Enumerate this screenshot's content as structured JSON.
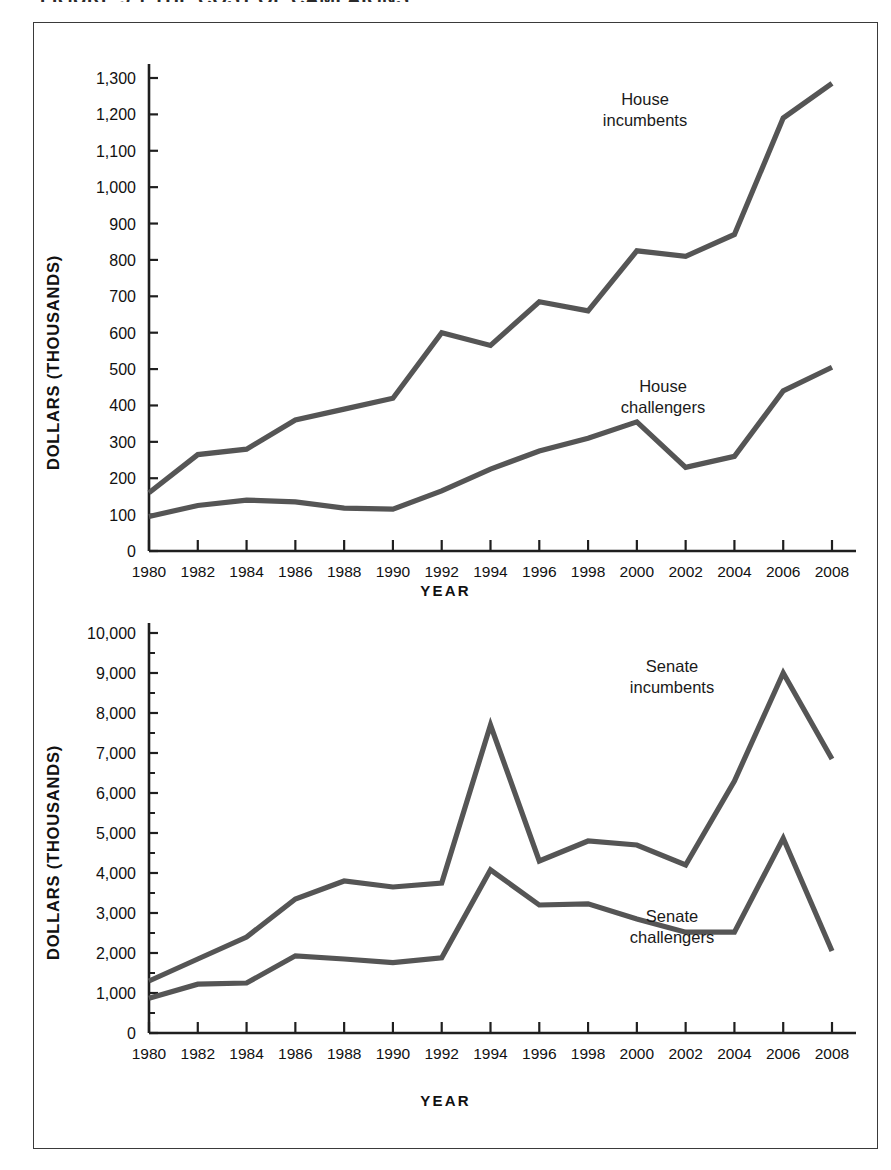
{
  "figure": {
    "title": "FIGURE 9.1  THE COST OF CAMPAIGNS",
    "frame_color": "#3a3a3a",
    "line_color": "#555555",
    "background": "#ffffff"
  },
  "chart_data": [
    {
      "id": "house",
      "type": "line",
      "title": "",
      "xlabel": "YEAR",
      "ylabel": "DOLLARS (THOUSANDS)",
      "x": [
        1980,
        1982,
        1984,
        1986,
        1988,
        1990,
        1992,
        1994,
        1996,
        1998,
        2000,
        2002,
        2004,
        2006,
        2008
      ],
      "xticklabels": [
        "1980",
        "1982",
        "1984",
        "1986",
        "1988",
        "1990",
        "1992",
        "1994",
        "1996",
        "1998",
        "2000",
        "2002",
        "2004",
        "2006",
        "2008"
      ],
      "xlim": [
        1980,
        2008
      ],
      "ylim": [
        0,
        1300
      ],
      "yticks": [
        0,
        100,
        200,
        300,
        400,
        500,
        600,
        700,
        800,
        900,
        1000,
        1100,
        1200,
        1300
      ],
      "yticklabels": [
        "0",
        "100",
        "200",
        "300",
        "400",
        "500",
        "600",
        "700",
        "800",
        "900",
        "1,000",
        "1,100",
        "1,200",
        "1,300"
      ],
      "grid": false,
      "legend": "inline-annotations",
      "series": [
        {
          "name": "House incumbents",
          "annotation": "House\nincumbents",
          "annotation_line1": "House",
          "annotation_line2": "incumbents",
          "values": [
            160,
            265,
            280,
            360,
            390,
            420,
            600,
            565,
            685,
            660,
            825,
            810,
            870,
            1190,
            1285
          ]
        },
        {
          "name": "House challengers",
          "annotation": "House\nchallengers",
          "annotation_line1": "House",
          "annotation_line2": "challengers",
          "values": [
            95,
            125,
            140,
            135,
            118,
            115,
            165,
            225,
            275,
            310,
            355,
            230,
            260,
            440,
            505
          ]
        }
      ]
    },
    {
      "id": "senate",
      "type": "line",
      "title": "",
      "xlabel": "YEAR",
      "ylabel": "DOLLARS (THOUSANDS)",
      "x": [
        1980,
        1982,
        1984,
        1986,
        1988,
        1990,
        1992,
        1994,
        1996,
        1998,
        2000,
        2002,
        2004,
        2006,
        2008
      ],
      "xticklabels": [
        "1980",
        "1982",
        "1984",
        "1986",
        "1988",
        "1990",
        "1992",
        "1994",
        "1996",
        "1998",
        "2000",
        "2002",
        "2004",
        "2006",
        "2008"
      ],
      "xlim": [
        1980,
        2008
      ],
      "ylim": [
        0,
        10000
      ],
      "yticks": [
        0,
        1000,
        2000,
        3000,
        4000,
        5000,
        6000,
        7000,
        8000,
        9000,
        10000
      ],
      "yticklabels": [
        "0",
        "1,000",
        "2,000",
        "3,000",
        "4,000",
        "5,000",
        "6,000",
        "7,000",
        "8,000",
        "9,000",
        "10,000"
      ],
      "grid": false,
      "legend": "inline-annotations",
      "series": [
        {
          "name": "Senate incumbents",
          "annotation": "Senate\nincumbents",
          "annotation_line1": "Senate",
          "annotation_line2": "incumbents",
          "values": [
            1300,
            1850,
            2400,
            3350,
            3800,
            3650,
            3750,
            7700,
            4300,
            4800,
            4700,
            4200,
            6300,
            9000,
            6850
          ]
        },
        {
          "name": "Senate challengers",
          "annotation": "Senate\nchallengers",
          "annotation_line1": "Senate",
          "annotation_line2": "challengers",
          "values": [
            870,
            1220,
            1250,
            1930,
            1850,
            1760,
            1880,
            4080,
            3200,
            3230,
            2850,
            2520,
            2520,
            4870,
            2050
          ]
        }
      ]
    }
  ],
  "annotations": {
    "house_incumbents_line1": "House",
    "house_incumbents_line2": "incumbents",
    "house_challengers_line1": "House",
    "house_challengers_line2": "challengers",
    "senate_incumbents_line1": "Senate",
    "senate_incumbents_line2": "incumbents",
    "senate_challengers_line1": "Senate",
    "senate_challengers_line2": "challengers"
  },
  "axis_labels": {
    "house_y": "DOLLARS (THOUSANDS)",
    "house_x": "YEAR",
    "senate_y": "DOLLARS (THOUSANDS)",
    "senate_x": "YEAR"
  }
}
